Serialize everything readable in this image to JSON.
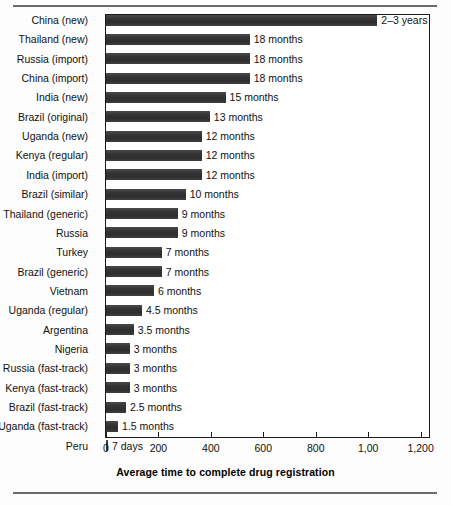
{
  "chart_data": {
    "type": "bar",
    "orientation": "horizontal",
    "title": "",
    "xlabel": "Average time to complete drug registration",
    "ylabel": "",
    "xlim": [
      0,
      1232
    ],
    "xticks": [
      0,
      200,
      400,
      600,
      800,
      1000,
      1200
    ],
    "xticklabels": [
      "0",
      "200",
      "400",
      "600",
      "800",
      "1,00",
      "1,200"
    ],
    "grid": false,
    "legend": null,
    "units": "days",
    "bar_color": "#343434",
    "categories": [
      "China (new)",
      "Thailand (new)",
      "Russia (import)",
      "China (import)",
      "India (new)",
      "Brazil (original)",
      "Uganda (new)",
      "Kenya (regular)",
      "India (import)",
      "Brazil (similar)",
      "Thailand (generic)",
      "Russia",
      "Turkey",
      "Brazil (generic)",
      "Vietnam",
      "Uganda (regular)",
      "Argentina",
      "Nigeria",
      "Russia (fast-track)",
      "Kenya (fast-track)",
      "Brazil (fast-track)",
      "Uganda (fast-track)",
      "Peru"
    ],
    "values": [
      1035,
      548,
      548,
      548,
      456,
      396,
      365,
      365,
      365,
      304,
      274,
      274,
      213,
      213,
      183,
      137,
      106,
      91,
      91,
      91,
      76,
      46,
      7
    ],
    "annotations": [
      "2–3 years",
      "18 months",
      "18 months",
      "18 months",
      "15 months",
      "13 months",
      "12 months",
      "12 months",
      "12 months",
      "10 months",
      "9 months",
      "9 months",
      "7 months",
      "7 months",
      "6 months",
      "4.5 months",
      "3.5 months",
      "3 months",
      "3 months",
      "3 months",
      "2.5 months",
      "1.5 months",
      "7 days"
    ]
  }
}
